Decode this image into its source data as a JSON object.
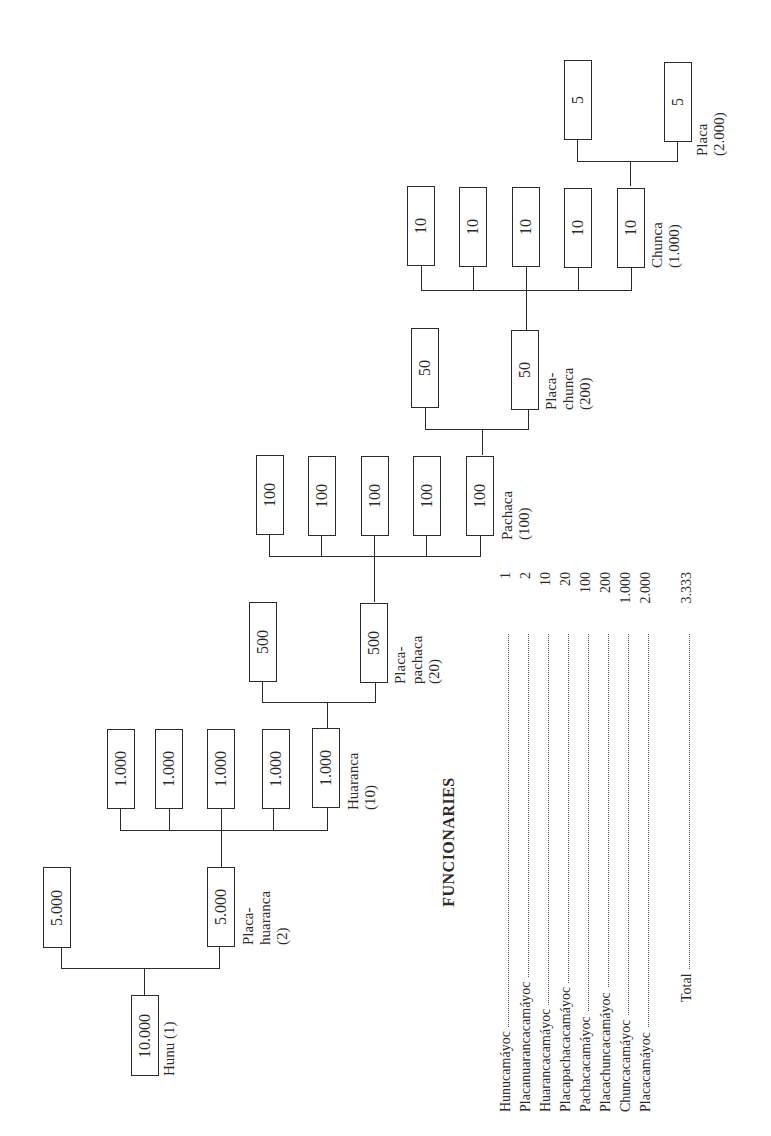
{
  "diagram": {
    "orientation": "rotated -90deg",
    "levels": [
      {
        "box_value": "10.000",
        "count": 1,
        "label": [
          "Hunu (1)"
        ]
      },
      {
        "box_value": "5.000",
        "count": 2,
        "label": [
          "Placa-",
          "huaranca",
          "(2)"
        ]
      },
      {
        "box_value": "1.000",
        "count": 5,
        "label": [
          "Huaranca",
          "(10)"
        ]
      },
      {
        "box_value": "500",
        "count": 2,
        "label": [
          "Placa-",
          "pachaca",
          "(20)"
        ]
      },
      {
        "box_value": "100",
        "count": 5,
        "label": [
          "Pachaca",
          "(100)"
        ]
      },
      {
        "box_value": "50",
        "count": 2,
        "label": [
          "Placa-",
          "chunca",
          "(200)"
        ]
      },
      {
        "box_value": "10",
        "count": 5,
        "label": [
          "Chunca",
          "(1.000)"
        ]
      },
      {
        "box_value": "5",
        "count": 2,
        "label": [
          "Placa",
          "(2.000)"
        ]
      }
    ]
  },
  "table": {
    "title": "FUNCIONARIES",
    "rows": [
      {
        "name": "Hunucamáyoc",
        "value": "1"
      },
      {
        "name": "Placanuarancacamáyoc",
        "value": "2"
      },
      {
        "name": "Huarancacamáyoc",
        "value": "10"
      },
      {
        "name": "Placapachacacamáyoc",
        "value": "20"
      },
      {
        "name": "Pachacacamáyoc",
        "value": "100"
      },
      {
        "name": "Placachuncacamáyoc",
        "value": "200"
      },
      {
        "name": "Chuncacamáyoc",
        "value": "1.000"
      },
      {
        "name": "Placacamáyoc",
        "value": "2.000"
      }
    ],
    "total": {
      "name": "Total",
      "value": "3.333"
    }
  }
}
